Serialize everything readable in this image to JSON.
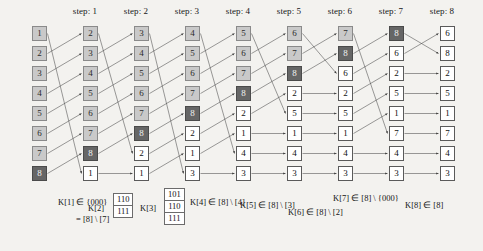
{
  "figure": {
    "type": "permutation-network-diagram",
    "background": "#f3f2ef",
    "columns": 9,
    "rows": 8,
    "colors": {
      "unprocessed": "#c9c9c9",
      "marker": "#666666",
      "processed": "#ffffff",
      "edge": "#3a3a3a"
    }
  },
  "step_headers": [
    {
      "label": "step: 1",
      "x": 85
    },
    {
      "label": "step: 2",
      "x": 136
    },
    {
      "label": "step: 3",
      "x": 187
    },
    {
      "label": "step: 4",
      "x": 238
    },
    {
      "label": "step: 5",
      "x": 289
    },
    {
      "label": "step: 6",
      "x": 340
    },
    {
      "label": "step: 7",
      "x": 391
    },
    {
      "label": "step: 8",
      "x": 442
    }
  ],
  "columns": [
    {
      "index": 0,
      "x": 32,
      "cells": [
        {
          "value": "1",
          "state": "light"
        },
        {
          "value": "2",
          "state": "light"
        },
        {
          "value": "3",
          "state": "light"
        },
        {
          "value": "4",
          "state": "light"
        },
        {
          "value": "5",
          "state": "light"
        },
        {
          "value": "6",
          "state": "light"
        },
        {
          "value": "7",
          "state": "light"
        },
        {
          "value": "8",
          "state": "dark"
        }
      ]
    },
    {
      "index": 1,
      "x": 83,
      "cells": [
        {
          "value": "2",
          "state": "light"
        },
        {
          "value": "3",
          "state": "light"
        },
        {
          "value": "4",
          "state": "light"
        },
        {
          "value": "5",
          "state": "light"
        },
        {
          "value": "6",
          "state": "light"
        },
        {
          "value": "7",
          "state": "light"
        },
        {
          "value": "8",
          "state": "dark"
        },
        {
          "value": "1",
          "state": "white"
        }
      ]
    },
    {
      "index": 2,
      "x": 134,
      "cells": [
        {
          "value": "3",
          "state": "light"
        },
        {
          "value": "4",
          "state": "light"
        },
        {
          "value": "5",
          "state": "light"
        },
        {
          "value": "6",
          "state": "light"
        },
        {
          "value": "7",
          "state": "light"
        },
        {
          "value": "8",
          "state": "dark"
        },
        {
          "value": "2",
          "state": "white"
        },
        {
          "value": "1",
          "state": "white"
        }
      ]
    },
    {
      "index": 3,
      "x": 185,
      "cells": [
        {
          "value": "4",
          "state": "light"
        },
        {
          "value": "5",
          "state": "light"
        },
        {
          "value": "6",
          "state": "light"
        },
        {
          "value": "7",
          "state": "light"
        },
        {
          "value": "8",
          "state": "dark"
        },
        {
          "value": "2",
          "state": "white"
        },
        {
          "value": "1",
          "state": "white"
        },
        {
          "value": "3",
          "state": "white"
        }
      ]
    },
    {
      "index": 4,
      "x": 236,
      "cells": [
        {
          "value": "5",
          "state": "light"
        },
        {
          "value": "6",
          "state": "light"
        },
        {
          "value": "7",
          "state": "light"
        },
        {
          "value": "8",
          "state": "dark"
        },
        {
          "value": "2",
          "state": "white"
        },
        {
          "value": "1",
          "state": "white"
        },
        {
          "value": "4",
          "state": "white"
        },
        {
          "value": "3",
          "state": "white"
        }
      ]
    },
    {
      "index": 5,
      "x": 287,
      "cells": [
        {
          "value": "6",
          "state": "light"
        },
        {
          "value": "7",
          "state": "light"
        },
        {
          "value": "8",
          "state": "dark"
        },
        {
          "value": "2",
          "state": "white"
        },
        {
          "value": "5",
          "state": "white"
        },
        {
          "value": "1",
          "state": "white"
        },
        {
          "value": "4",
          "state": "white"
        },
        {
          "value": "3",
          "state": "white"
        }
      ]
    },
    {
      "index": 6,
      "x": 338,
      "cells": [
        {
          "value": "7",
          "state": "light"
        },
        {
          "value": "8",
          "state": "dark"
        },
        {
          "value": "6",
          "state": "white"
        },
        {
          "value": "2",
          "state": "white"
        },
        {
          "value": "5",
          "state": "white"
        },
        {
          "value": "1",
          "state": "white"
        },
        {
          "value": "4",
          "state": "white"
        },
        {
          "value": "3",
          "state": "white"
        }
      ]
    },
    {
      "index": 7,
      "x": 389,
      "cells": [
        {
          "value": "8",
          "state": "dark"
        },
        {
          "value": "6",
          "state": "white"
        },
        {
          "value": "2",
          "state": "white"
        },
        {
          "value": "5",
          "state": "white"
        },
        {
          "value": "1",
          "state": "white"
        },
        {
          "value": "7",
          "state": "white"
        },
        {
          "value": "4",
          "state": "white"
        },
        {
          "value": "3",
          "state": "white"
        }
      ]
    },
    {
      "index": 8,
      "x": 440,
      "cells": [
        {
          "value": "6",
          "state": "white"
        },
        {
          "value": "8",
          "state": "white"
        },
        {
          "value": "2",
          "state": "white"
        },
        {
          "value": "5",
          "state": "white"
        },
        {
          "value": "1",
          "state": "white"
        },
        {
          "value": "7",
          "state": "white"
        },
        {
          "value": "4",
          "state": "white"
        },
        {
          "value": "3",
          "state": "white"
        }
      ]
    }
  ],
  "annotations": {
    "k1_line1": "K[1] ∈ {000}",
    "k1_line2": "= [8] \\ [7]",
    "k2_name": "K[2]",
    "k2_bits": [
      "110",
      "111"
    ],
    "k3_name": "K[3]",
    "k3_bits": [
      "101",
      "110",
      "111"
    ],
    "k4": "K[4] ∈ [8] \\ [4]",
    "k5": "K[5] ∈ [8] \\ [3]",
    "k6": "K[6] ∈ [8] \\ [2]",
    "k7": "K[7] ∈ [8] \\ {000}",
    "k8": "K[8] ∈ [8]"
  }
}
